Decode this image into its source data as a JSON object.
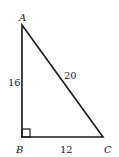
{
  "diagram": {
    "type": "right-triangle",
    "vertices": {
      "A": {
        "label": "A"
      },
      "B": {
        "label": "B"
      },
      "C": {
        "label": "C"
      }
    },
    "sides": {
      "AB": {
        "label": "16"
      },
      "AC": {
        "label": "20"
      },
      "BC": {
        "label": "12"
      }
    },
    "right_angle_at": "B",
    "stroke_color": "#1a1a1a"
  }
}
